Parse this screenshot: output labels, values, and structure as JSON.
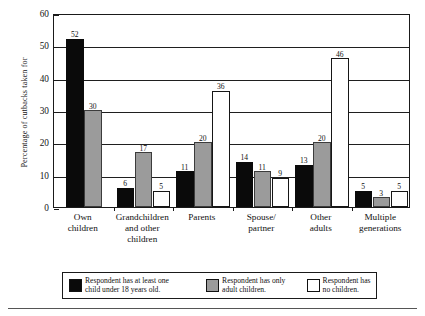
{
  "chart_data": {
    "type": "bar",
    "title": "",
    "xlabel": "",
    "ylabel": "Percentage of cutbacks taken for",
    "ylim": [
      0,
      60
    ],
    "yticks": [
      0,
      10,
      20,
      30,
      40,
      50,
      60
    ],
    "grid": true,
    "legend_position": "bottom",
    "categories": [
      "Own children",
      "Grandchildren and other children",
      "Parents",
      "Spouse/ partner",
      "Other adults",
      "Multiple generations"
    ],
    "category_lines": [
      [
        "Own",
        "children"
      ],
      [
        "Grandchildren",
        "and other",
        "children"
      ],
      [
        "Parents"
      ],
      [
        "Spouse/",
        "partner"
      ],
      [
        "Other",
        "adults"
      ],
      [
        "Multiple",
        "generations"
      ]
    ],
    "series": [
      {
        "name": "Respondent has at least one child under 18 years old.",
        "color": "#0a0a0a",
        "fill": "black",
        "values": [
          52,
          6,
          11,
          14,
          13,
          5
        ]
      },
      {
        "name": "Respondent has only adult children.",
        "color": "#9b9b9b",
        "fill": "gray",
        "values": [
          30,
          17,
          20,
          11,
          20,
          3
        ]
      },
      {
        "name": "Respondent has no children.",
        "color": "#ffffff",
        "fill": "white",
        "values": [
          null,
          5,
          36,
          9,
          46,
          5
        ]
      }
    ]
  },
  "legend": {
    "items": [
      {
        "swatch": "black",
        "line1": "Respondent has at least one",
        "line2": "child under 18 years old."
      },
      {
        "swatch": "gray",
        "line1": "Respondent has only",
        "line2": "adult children."
      },
      {
        "swatch": "white",
        "line1": "Respondent has",
        "line2": "no children."
      }
    ]
  }
}
